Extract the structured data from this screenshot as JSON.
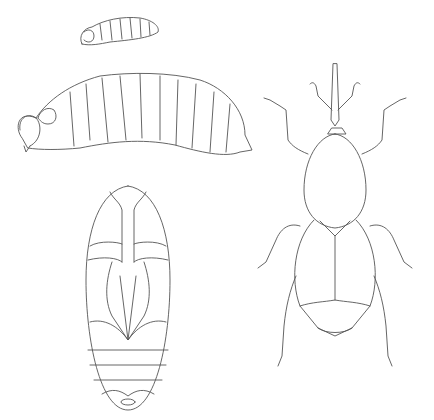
{
  "illustration": {
    "subject": "weevil life stages",
    "stages": [
      "small-larva",
      "larva",
      "pupa",
      "adult"
    ],
    "line_color": "#555555",
    "background": "#ffffff"
  }
}
